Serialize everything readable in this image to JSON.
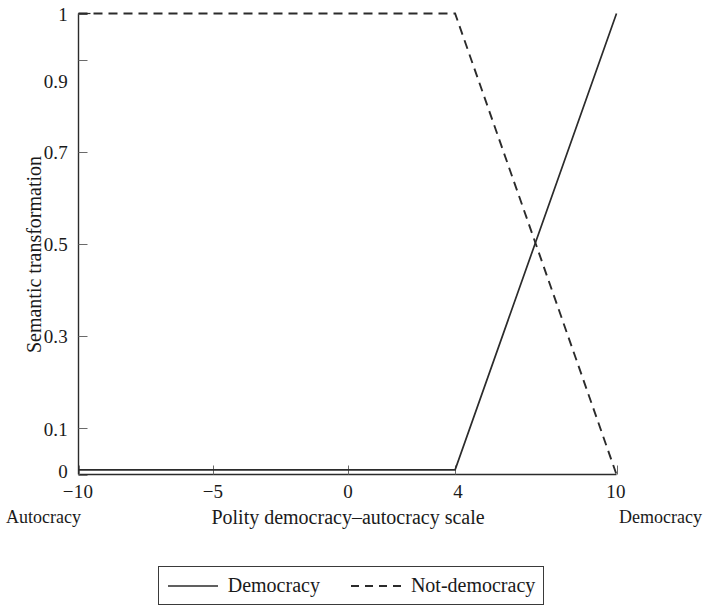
{
  "chart_data": {
    "type": "line",
    "title": "",
    "xlabel": "Polity democracy–autocracy scale",
    "ylabel": "Semantic transformation",
    "xlim": [
      -10,
      10
    ],
    "ylim": [
      0,
      1
    ],
    "grid": false,
    "legend_position": "bottom-center",
    "x_ticks": [
      -10,
      -5,
      0,
      4,
      10
    ],
    "x_tick_labels": [
      "−10",
      "−5",
      "0",
      "4",
      "10"
    ],
    "y_ticks": [
      0,
      0.1,
      0.3,
      0.5,
      0.7,
      0.9,
      1
    ],
    "y_tick_labels": [
      "0",
      "0.1",
      "0.3",
      "0.5",
      "0.7",
      "0.9",
      "1"
    ],
    "axis_anchor_left": "Autocracy",
    "axis_anchor_right": "Democracy",
    "series": [
      {
        "name": "Democracy",
        "style": "solid",
        "color": "#2b2b2b",
        "x": [
          -10,
          4,
          10
        ],
        "values": [
          0.01,
          0.01,
          1.0
        ]
      },
      {
        "name": "Not-democracy",
        "style": "dashed",
        "color": "#2b2b2b",
        "x": [
          -10,
          4,
          10
        ],
        "values": [
          1.0,
          1.0,
          0.0
        ]
      }
    ],
    "annotations": {
      "crossing_point": {
        "x": 7.05,
        "y": 0.5
      }
    }
  },
  "axes": {
    "ylabel": "Semantic transformation",
    "xlabel": "Polity democracy–autocracy scale",
    "left_anchor": "Autocracy",
    "right_anchor": "Democracy",
    "y_tick_labels": [
      "1",
      "0.9",
      "0.7",
      "0.5",
      "0.3",
      "0.1",
      "0"
    ],
    "x_tick_labels": [
      "−10",
      "−5",
      "0",
      "4",
      "10"
    ]
  },
  "legend": {
    "entries": [
      {
        "label": "Democracy",
        "style": "solid"
      },
      {
        "label": "Not-democracy",
        "style": "dashed"
      }
    ]
  }
}
